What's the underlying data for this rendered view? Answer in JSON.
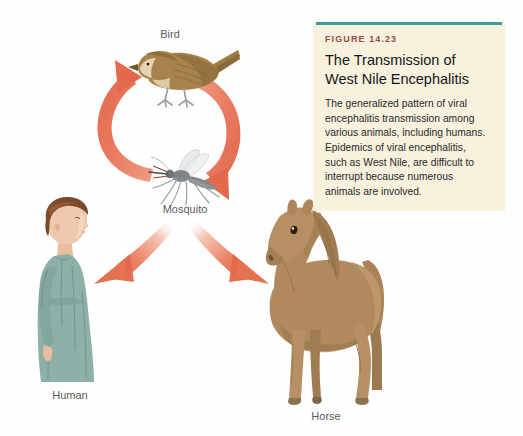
{
  "figure": {
    "number": "FIGURE 14.23",
    "title": "The Transmission of West Nile Encephalitis",
    "body": "The generalized pattern of viral encephalitis transmission among various animals, including humans. Epidemics of viral encephalitis, such as West Nile, are difficult to interrupt because numerous animals are involved.",
    "rule_color": "#3f9a9a",
    "panel_color": "#f7f1dd",
    "number_color": "#9c4a43"
  },
  "diagram": {
    "arrow_color": "#e8785c",
    "labels": {
      "bird": "Bird",
      "mosquito": "Mosquito",
      "human": "Human",
      "horse": "Horse"
    },
    "nodes": [
      {
        "id": "bird",
        "label": "Bird"
      },
      {
        "id": "mosquito",
        "label": "Mosquito"
      },
      {
        "id": "human",
        "label": "Human"
      },
      {
        "id": "horse",
        "label": "Horse"
      }
    ],
    "arrows": [
      {
        "from": "mosquito",
        "to": "bird",
        "style": "curved-left"
      },
      {
        "from": "bird",
        "to": "mosquito",
        "style": "curved-right"
      },
      {
        "from": "mosquito",
        "to": "human",
        "style": "diverging-left"
      },
      {
        "from": "mosquito",
        "to": "horse",
        "style": "diverging-right"
      }
    ]
  }
}
